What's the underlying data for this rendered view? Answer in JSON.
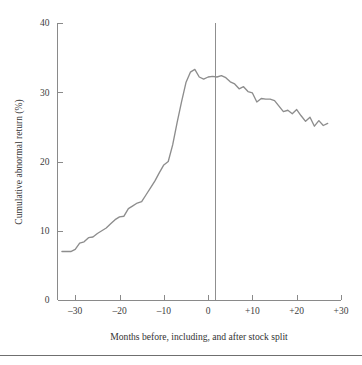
{
  "chart_data": {
    "type": "line",
    "title": "",
    "xlabel": "Months before, including, and after stock split",
    "ylabel": "Cumulative abnormal return (%)",
    "xlim": [
      -34,
      30
    ],
    "ylim": [
      0,
      40
    ],
    "xticks": [
      -30,
      -20,
      -10,
      0,
      10,
      20,
      30
    ],
    "xticklabels": [
      "–30",
      "–20",
      "–10",
      "0",
      "+10",
      "+20",
      "+30"
    ],
    "yticks": [
      0,
      10,
      20,
      30,
      40
    ],
    "yticklabels": [
      "0",
      "10",
      "20",
      "30",
      "40"
    ],
    "grid": false,
    "legend": null,
    "annotations": [
      {
        "name": "split-event-line",
        "x": 0,
        "label": "",
        "description": "vertical reference line at month 0 (stock split month)"
      }
    ],
    "line_color": "#8d8d8d",
    "axis_color": "#8a8a8a",
    "series": [
      {
        "name": "Cumulative abnormal return",
        "x": [
          -33,
          -32,
          -31,
          -30,
          -29,
          -28,
          -27,
          -26,
          -25,
          -24,
          -23,
          -22,
          -21,
          -20,
          -19,
          -18,
          -17,
          -16,
          -15,
          -14,
          -13,
          -12,
          -11,
          -10,
          -9,
          -8,
          -7,
          -6,
          -5,
          -4,
          -3,
          -2,
          -1,
          0,
          1,
          2,
          3,
          4,
          5,
          6,
          7,
          8,
          9,
          10,
          11,
          12,
          13,
          14,
          15,
          16,
          17,
          18,
          19,
          20,
          21,
          22,
          23,
          24,
          25,
          26,
          27
        ],
        "values": [
          7.0,
          7.0,
          7.0,
          7.3,
          8.2,
          8.4,
          9.0,
          9.1,
          9.6,
          10.0,
          10.4,
          11.0,
          11.6,
          12.0,
          12.1,
          13.2,
          13.6,
          14.0,
          14.2,
          15.2,
          16.2,
          17.2,
          18.4,
          19.5,
          20.0,
          22.4,
          25.6,
          28.6,
          31.4,
          32.9,
          33.3,
          32.2,
          31.9,
          32.2,
          32.3,
          32.2,
          32.4,
          32.1,
          31.5,
          31.2,
          30.5,
          30.8,
          30.1,
          29.9,
          28.6,
          29.1,
          29.0,
          29.0,
          28.8,
          28.0,
          27.2,
          27.4,
          26.9,
          27.5,
          26.6,
          25.8,
          26.4,
          25.1,
          25.9,
          25.2,
          25.5
        ]
      }
    ]
  }
}
